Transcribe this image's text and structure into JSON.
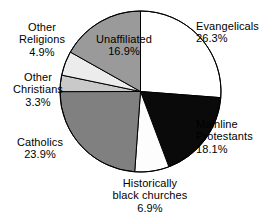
{
  "chart_data": {
    "type": "pie",
    "title": "",
    "subtitle": "",
    "xlabel": "",
    "ylabel": "",
    "legend_position": "none",
    "grid": false,
    "labels_outside": true,
    "start_angle_deg": 0,
    "direction": "clockwise",
    "categories": [
      "Evangelicals",
      "Mainline Protestants",
      "Historically black churches",
      "Catholics",
      "Other Christians",
      "Other Religions",
      "Unaffiliated"
    ],
    "values": [
      26.3,
      18.1,
      6.9,
      23.9,
      3.3,
      4.9,
      16.9
    ],
    "value_suffix": "%",
    "slices": [
      {
        "name": "Evangelicals",
        "label_line1": "Evangelicals",
        "label_line2": "26.3%",
        "value": 26.3,
        "fill": "#ffffff",
        "stroke": "#000000"
      },
      {
        "name": "Mainline Protestants",
        "label_line1": "Mainline",
        "label_line2": "Protestants",
        "label_line3": "18.1%",
        "value": 18.1,
        "fill": "#0a0a0a",
        "stroke": "#000000"
      },
      {
        "name": "Historically black churches",
        "label_line1": "Historically",
        "label_line2": "black churches",
        "label_line3": "6.9%",
        "value": 6.9,
        "fill": "#fdfdfd",
        "stroke": "#000000"
      },
      {
        "name": "Catholics",
        "label_line1": "Catholics",
        "label_line2": "23.9%",
        "value": 23.9,
        "fill": "#808080",
        "stroke": "#000000"
      },
      {
        "name": "Other Christians",
        "label_line1": "Other",
        "label_line2": "Christians",
        "label_line3": "3.3%",
        "value": 3.3,
        "fill": "#c9c9c9",
        "stroke": "#000000"
      },
      {
        "name": "Other Religions",
        "label_line1": "Other",
        "label_line2": "Religions",
        "label_line3": "4.9%",
        "value": 4.9,
        "fill": "#ececec",
        "stroke": "#000000"
      },
      {
        "name": "Unaffiliated",
        "label_line1": "Unaffiliated",
        "label_line2": "16.9%",
        "value": 16.9,
        "fill": "#9a9a9a",
        "stroke": "#000000"
      }
    ],
    "geometry": {
      "center_x": 140.5,
      "center_y": 91.5,
      "radius": 80.5
    },
    "colors": {
      "background": "#ffffff",
      "text": "#000000",
      "outline": "#000000"
    }
  }
}
